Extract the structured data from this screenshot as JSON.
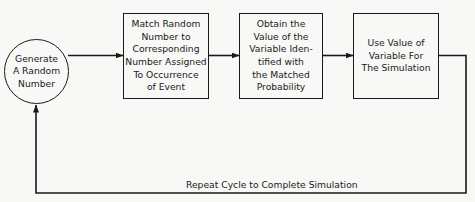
{
  "diagram": {
    "type": "flowchart",
    "nodes": [
      {
        "id": "generate",
        "shape": "circle",
        "lines": [
          "Generate",
          "A Random",
          "Number"
        ]
      },
      {
        "id": "match",
        "shape": "box",
        "lines": [
          "Match Random",
          "Number to",
          "Corresponding",
          "Number Assigned",
          "To Occurrence",
          "of Event"
        ]
      },
      {
        "id": "obtain",
        "shape": "box",
        "lines": [
          "Obtain the",
          "Value of the",
          "Variable Iden-",
          "tified with",
          "the Matched",
          "Probability"
        ]
      },
      {
        "id": "use",
        "shape": "box",
        "lines": [
          "Use Value of",
          "Variable For",
          "The Simulation"
        ]
      }
    ],
    "edges": [
      {
        "from": "generate",
        "to": "match"
      },
      {
        "from": "match",
        "to": "obtain"
      },
      {
        "from": "obtain",
        "to": "use"
      },
      {
        "from": "use",
        "to": "generate",
        "label": "Repeat Cycle to Complete Simulation"
      }
    ],
    "feedback_label": "Repeat Cycle to Complete Simulation"
  }
}
